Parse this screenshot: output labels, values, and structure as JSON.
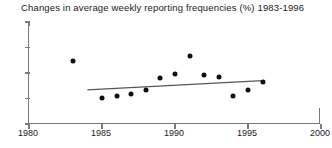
{
  "chart_data": {
    "type": "scatter",
    "title": "Changes in average weekly reporting frequencies (%) 1983-1996",
    "xlabel": "",
    "ylabel": "",
    "xlim": [
      1980,
      2000
    ],
    "ylim": [
      0.5,
      2.5
    ],
    "xticks": [
      1980,
      1985,
      1990,
      1995,
      2000
    ],
    "xtick_labels": [
      "1980",
      "1985",
      "1990",
      "1995",
      "2000"
    ],
    "yticks": [
      0.5,
      1.0,
      1.5,
      2.0,
      2.5
    ],
    "ytick_labels": [
      "0.5",
      "1.0",
      "1.5",
      "2.0",
      "2.5"
    ],
    "grid": false,
    "legend": "none",
    "marker_color": "#111111",
    "trend_color": "#555555",
    "axis_color": "#7a7a7a",
    "x": [
      1983,
      1985,
      1986,
      1987,
      1988,
      1989,
      1990,
      1991,
      1992,
      1993,
      1994,
      1995,
      1996
    ],
    "y": [
      1.74,
      1.01,
      1.05,
      1.09,
      1.17,
      1.4,
      1.48,
      1.83,
      1.46,
      1.42,
      1.05,
      1.17,
      1.33
    ],
    "points": [
      {
        "x": 1983,
        "y": 1.74
      },
      {
        "x": 1985,
        "y": 1.01
      },
      {
        "x": 1986,
        "y": 1.05
      },
      {
        "x": 1987,
        "y": 1.09
      },
      {
        "x": 1988,
        "y": 1.17
      },
      {
        "x": 1989,
        "y": 1.4
      },
      {
        "x": 1990,
        "y": 1.48
      },
      {
        "x": 1991,
        "y": 1.83
      },
      {
        "x": 1992,
        "y": 1.46
      },
      {
        "x": 1993,
        "y": 1.42
      },
      {
        "x": 1994,
        "y": 1.05
      },
      {
        "x": 1995,
        "y": 1.17
      },
      {
        "x": 1996,
        "y": 1.33
      }
    ],
    "trendline": {
      "type": "linear-fit",
      "x_start": 1984.0,
      "y_start": 1.17,
      "x_end": 1996.0,
      "y_end": 1.35
    }
  }
}
